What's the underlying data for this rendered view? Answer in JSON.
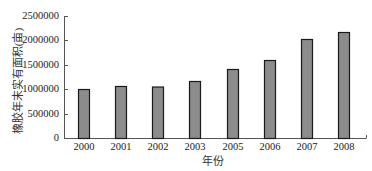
{
  "chart_data": {
    "type": "bar",
    "title": "",
    "xlabel": "年份",
    "ylabel": "橡胶年末实有面积(亩)",
    "categories": [
      "2000",
      "2001",
      "2002",
      "2003",
      "2005",
      "2006",
      "2007",
      "2008"
    ],
    "values": [
      1004000,
      1066000,
      1055000,
      1168000,
      1414000,
      1598000,
      2029000,
      2172000
    ],
    "ylim": [
      0,
      2500000
    ],
    "yticks": [
      0,
      500000,
      1000000,
      1500000,
      2000000,
      2500000
    ],
    "ytick_labels": [
      "0",
      "500000",
      "1000000",
      "1500000",
      "2000000",
      "2500000"
    ],
    "grid": false,
    "legend": null,
    "bar_color": "#8c8c8c",
    "bar_edge_color": "#1a1a1a"
  }
}
